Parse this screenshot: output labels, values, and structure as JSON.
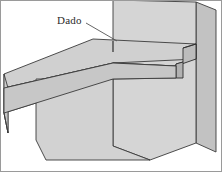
{
  "figure": {
    "type": "technical-line-drawing",
    "background_color": "#ffffff",
    "border_color": "#9a9a9a"
  },
  "annotation": {
    "label": "Dado",
    "label_x": 57,
    "label_y": 24,
    "leader": {
      "from_x": 86,
      "from_y": 23,
      "to_x": 117,
      "to_y": 41
    }
  },
  "parts": {
    "vertical_board": {
      "name": "vertical board",
      "face_color": "#d3d3d3",
      "edge_color": "#b9b9b9",
      "outline_color": "#3a3a3a"
    },
    "shelf_board": {
      "name": "horizontal shelf board",
      "face_color": "#cfcfcf",
      "edge_color": "#c4c4c4",
      "outline_color": "#3a3a3a"
    },
    "dado_groove": {
      "name": "dado groove",
      "inner_color": "#c0c0c0",
      "outline_color": "#2e2e2e"
    }
  },
  "colors": {
    "line": "#3a3a3a",
    "light_face": "#d5d5d5",
    "mid_face": "#cacaca",
    "dark_face": "#bdbdbd",
    "leader_line": "#555555",
    "border": "#9a9a9a"
  }
}
